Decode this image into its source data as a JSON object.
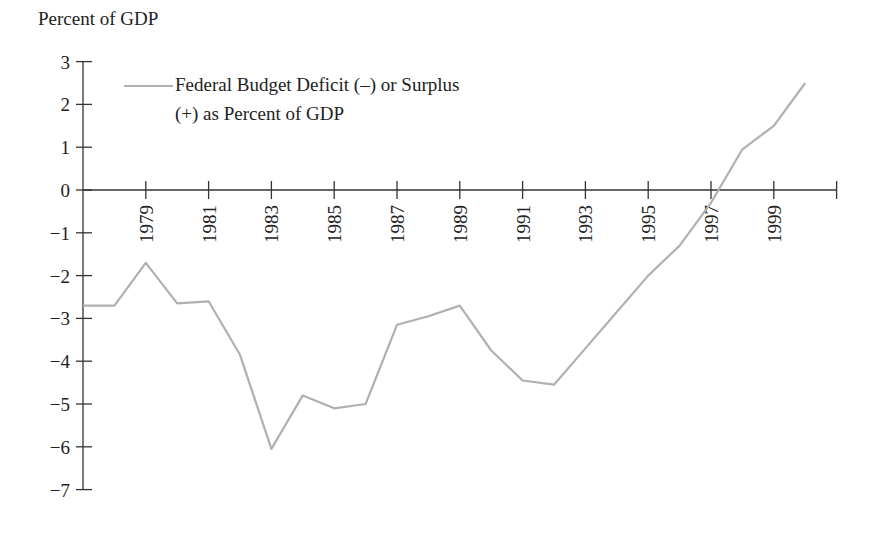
{
  "chart_data": {
    "type": "line",
    "title": "",
    "ylabel": "Percent of GDP",
    "xlabel": "",
    "ylim": [
      -7,
      3
    ],
    "xlim": [
      1977,
      2001
    ],
    "y_ticks": [
      "3",
      "2",
      "1",
      "0",
      "-1",
      "-2",
      "-3",
      "-4",
      "-5",
      "-6",
      "-7"
    ],
    "x_tick_labels": [
      "1979",
      "1981",
      "1983",
      "1985",
      "1987",
      "1989",
      "1991",
      "1993",
      "1995",
      "1997",
      "1999"
    ],
    "grid": false,
    "legend_position": "upper-left",
    "series": [
      {
        "name": "Federal Budget Deficit (–) or Surplus (+) as Percent of GDP",
        "color": "#b0b0b0",
        "x": [
          1977,
          1978,
          1979,
          1980,
          1981,
          1982,
          1983,
          1984,
          1985,
          1986,
          1987,
          1988,
          1989,
          1990,
          1991,
          1992,
          1993,
          1994,
          1995,
          1996,
          1997,
          1998,
          1999,
          2000
        ],
        "values": [
          -2.7,
          -2.7,
          -1.7,
          -2.65,
          -2.6,
          -3.85,
          -6.05,
          -4.8,
          -5.1,
          -5.0,
          -3.15,
          -2.95,
          -2.7,
          -3.75,
          -4.45,
          -4.55,
          -3.7,
          -2.85,
          -2.0,
          -1.3,
          -0.3,
          0.95,
          1.5,
          2.5
        ]
      }
    ]
  },
  "labels": {
    "ylabel": "Percent of GDP",
    "legend_line1": "Federal Budget Deficit (–) or Surplus",
    "legend_line2": "(+) as Percent of GDP"
  }
}
